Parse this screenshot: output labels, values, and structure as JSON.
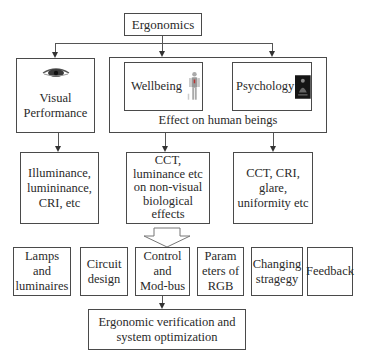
{
  "diagram": {
    "root": {
      "label": "Ergonomics"
    },
    "visual_performance": {
      "label": "Visual\nPerformance",
      "icon": "eye-icon"
    },
    "effect_group": {
      "caption": "Effect on human beings",
      "wellbeing": {
        "label": "Wellbeing",
        "icon": "human-anatomy-icon"
      },
      "psychology": {
        "label": "Psychology",
        "icon": "person-silhouette-icon"
      }
    },
    "factors": [
      {
        "label": "Illuminance,\nlumininance,\nCRI,  etc"
      },
      {
        "label": "CCT,\nluminance etc\non non-visual\nbiological\neffects"
      },
      {
        "label": "CCT, CRI,\nglare,\nuniformity etc"
      }
    ],
    "implementation": [
      {
        "label": "Lamps\nand\nluminaires"
      },
      {
        "label": "Circuit\ndesign"
      },
      {
        "label": "Control\nand\nMod-bus"
      },
      {
        "label": "Param\neters of\nRGB"
      },
      {
        "label": "Changing\nstragegy"
      },
      {
        "label": "Feedback"
      }
    ],
    "result": {
      "label": "Ergonomic verification and\nsystem  optimization"
    }
  }
}
